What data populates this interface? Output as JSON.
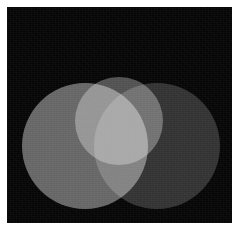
{
  "figure": {
    "width": 239,
    "height": 230,
    "canvas": {
      "x": 7,
      "y": 7,
      "width": 225,
      "height": 216,
      "background_color": "#050505",
      "page_color": "#ffffff"
    },
    "blend_mode": "screen",
    "render_style": "additive-light-mixing-grayscale"
  },
  "chart_data": {
    "type": "venn",
    "xlabel": "",
    "ylabel": "",
    "grid": false,
    "legend": "none",
    "blend": "screen",
    "background": "#050505",
    "sets": [
      {
        "name": "set-left",
        "label": "Left",
        "cx": 85,
        "cy": 146,
        "r": 63,
        "fill": "#636363",
        "alone_color": "#636363"
      },
      {
        "name": "set-right",
        "label": "Right",
        "cx": 157,
        "cy": 146,
        "r": 63,
        "fill": "#2e2e2e",
        "alone_color": "#2e2e2e"
      },
      {
        "name": "set-top",
        "label": "Top",
        "cx": 119,
        "cy": 121,
        "r": 44,
        "fill": "#4e4e4e",
        "alone_color": "#b0b0b0"
      }
    ],
    "region_colors": {
      "background": "#050505",
      "left_only": "#636363",
      "right_only": "#2e2e2e",
      "top_left_lobe": "#b0b0b0",
      "top_right_lobe": "#585858",
      "left_and_right": "#828282",
      "triple_overlap": "#f5f5f5"
    }
  },
  "annotations": {
    "caption": ""
  }
}
